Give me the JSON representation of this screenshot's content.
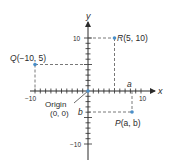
{
  "diagram": {
    "axes": {
      "x_label": "x",
      "y_label": "y",
      "x_range": [
        -10,
        10
      ],
      "y_range": [
        -10,
        10
      ],
      "x_tick_labels": [
        "−10",
        "10"
      ],
      "y_tick_labels": [
        "10",
        "−10"
      ],
      "tick_step": 1
    },
    "origin": {
      "label": "Origin",
      "coords": "(0, 0)"
    },
    "points": [
      {
        "name": "R",
        "label": "R(5, 10)",
        "x": 5,
        "y": 10
      },
      {
        "name": "Q",
        "label": "Q(−10, 5)",
        "x": -10,
        "y": 5
      },
      {
        "name": "P",
        "label": "P(a, b)",
        "x": 8.3,
        "y": -4
      }
    ],
    "variable_labels": {
      "a": "a",
      "b": "b"
    },
    "colors": {
      "axis": "#2b2b2b",
      "point": "#4a8fc9",
      "dashed": "#555555"
    }
  }
}
